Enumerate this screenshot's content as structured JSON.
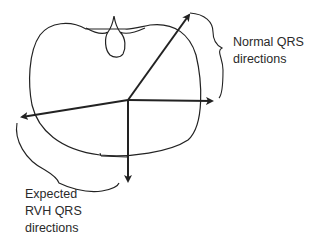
{
  "diagram": {
    "labels": {
      "normal": [
        "Normal QRS",
        "directions"
      ],
      "rvh": [
        "Expected",
        "RVH QRS",
        "directions"
      ]
    },
    "elements": {
      "outline": "chest-cross-section",
      "spine": "vertebra-notch",
      "origin": {
        "x": 128,
        "y": 100
      },
      "arrows": [
        {
          "name": "up-right",
          "group": "normal",
          "tip": {
            "x": 190,
            "y": 13
          }
        },
        {
          "name": "right",
          "group": "normal",
          "tip": {
            "x": 214,
            "y": 101
          }
        },
        {
          "name": "left",
          "group": "rvh",
          "tip": {
            "x": 20,
            "y": 117
          }
        },
        {
          "name": "down",
          "group": "rvh",
          "tip": {
            "x": 128,
            "y": 183
          }
        }
      ]
    },
    "colors": {
      "line": "#222222",
      "text": "#2a2a2a",
      "background": "#ffffff"
    }
  }
}
